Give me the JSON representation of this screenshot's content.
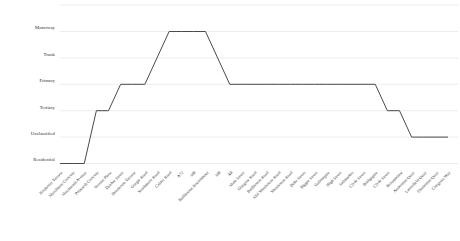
{
  "chart_data": {
    "type": "line",
    "title": "",
    "subtitle": "",
    "xlabel": "",
    "ylabel": "",
    "grid": true,
    "legend": "none",
    "line_color": "#4a4a4a",
    "grid_color": "#e4e4e4",
    "y_categories": [
      "Residential",
      "Unclassified",
      "Tertiary",
      "Primary",
      "Trunk",
      "Motorway"
    ],
    "ylim": [
      "Residential",
      "Motorway"
    ],
    "categories": [
      "Rochester Terrace",
      "Murchison Crescent",
      "Macdonald Avenue",
      "Polwarth Crescent",
      "Vernon Place",
      "Dunbar Street",
      "Henderson Terrace",
      "Gorgie Road",
      "Strathmore Road",
      "Calder Road",
      "A72",
      "M8",
      "Baillieston Roundabout",
      "M8",
      "A8",
      "Main Street",
      "Glasgow Road",
      "Baillieston Road",
      "Old Shettleston Road",
      "Shettleston Road",
      "Duke Street",
      "Biggar Street",
      "Gallowgate",
      "High Street",
      "Saltmarket",
      "Clyde Street",
      "Bridgegate",
      "Clyde Street",
      "Broomielaw",
      "Anderston Quay",
      "Lancefield Quay",
      "Finnieston Quay",
      "Congress Way"
    ],
    "values": [
      "Residential",
      "Residential",
      "Residential",
      "Tertiary",
      "Tertiary",
      "Primary",
      "Primary",
      "Primary",
      "Trunk",
      "Motorway",
      "Motorway",
      "Motorway",
      "Motorway",
      "Trunk",
      "Primary",
      "Primary",
      "Primary",
      "Primary",
      "Primary",
      "Primary",
      "Primary",
      "Primary",
      "Primary",
      "Primary",
      "Primary",
      "Primary",
      "Primary",
      "Tertiary",
      "Tertiary",
      "Unclassified",
      "Unclassified",
      "Unclassified",
      "Unclassified"
    ],
    "y_index_map": {
      "Residential": 0,
      "Unclassified": 1,
      "Tertiary": 2,
      "Primary": 3,
      "Trunk": 4,
      "Motorway": 5
    }
  }
}
